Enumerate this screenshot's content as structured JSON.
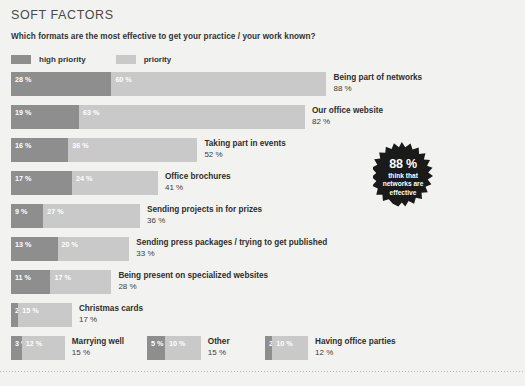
{
  "header": {
    "title": "SOFT FACTORS",
    "question": "Which formats are the most effective to get your practice / your work known?"
  },
  "legend": {
    "items": [
      {
        "label": "high priority",
        "color": "#8e8e8e",
        "key": "high"
      },
      {
        "label": "priority",
        "color": "#c9c9c9",
        "key": "normal"
      }
    ]
  },
  "badge": {
    "percent": "88 %",
    "caption": "think that networks are effective",
    "color": "#1a1a1a"
  },
  "chart_data": {
    "type": "bar",
    "title": "Which formats are the most effective to get your practice / your work known?",
    "subtitle": "SOFT FACTORS",
    "orientation": "horizontal",
    "stacked": true,
    "xlabel": "",
    "ylabel": "",
    "xlim": [
      0,
      88
    ],
    "grid": false,
    "legend_position": "top-left",
    "units": "%",
    "categories": [
      "Being part of networks",
      "Our office website",
      "Taking part in events",
      "Office brochures",
      "Sending projects in for prizes",
      "Sending press packages / trying to get published",
      "Being present on specialized websites",
      "Christmas cards",
      "Marrying well",
      "Other",
      "Having office parties"
    ],
    "series": [
      {
        "name": "high priority",
        "color": "#8e8e8e",
        "values": [
          28,
          19,
          16,
          17,
          9,
          13,
          11,
          2,
          3,
          5,
          2
        ]
      },
      {
        "name": "priority",
        "color": "#c9c9c9",
        "values": [
          60,
          63,
          36,
          24,
          27,
          20,
          17,
          15,
          12,
          10,
          10
        ]
      }
    ],
    "totals": [
      88,
      82,
      52,
      41,
      36,
      33,
      28,
      17,
      15,
      15,
      12
    ],
    "annotations": [
      {
        "text": "88 % think that networks are effective",
        "type": "starburst-badge"
      }
    ]
  },
  "rows": [
    {
      "name": "Being part of networks",
      "high": "28 %",
      "normal": "60 %",
      "total": "88 %",
      "high_val": 28,
      "normal_val": 60
    },
    {
      "name": "Our office website",
      "high": "19 %",
      "normal": "63 %",
      "total": "82 %",
      "high_val": 19,
      "normal_val": 63
    },
    {
      "name": "Taking part in events",
      "high": "16 %",
      "normal": "36 %",
      "total": "52 %",
      "high_val": 16,
      "normal_val": 36
    },
    {
      "name": "Office brochures",
      "high": "17 %",
      "normal": "24 %",
      "total": "41 %",
      "high_val": 17,
      "normal_val": 24
    },
    {
      "name": "Sending projects in for prizes",
      "high": "9 %",
      "normal": "27 %",
      "total": "36 %",
      "high_val": 9,
      "normal_val": 27
    },
    {
      "name": "Sending press packages / trying to get published",
      "high": "13 %",
      "normal": "20 %",
      "total": "33 %",
      "high_val": 13,
      "normal_val": 20
    },
    {
      "name": "Being present on specialized websites",
      "high": "11 %",
      "normal": "17 %",
      "total": "28 %",
      "high_val": 11,
      "normal_val": 17
    },
    {
      "name": "Christmas cards",
      "high": "2 %",
      "normal": "15 %",
      "total": "17 %",
      "high_val": 2,
      "normal_val": 15
    },
    {
      "name": "Marrying well",
      "high": "3 %",
      "normal": "12 %",
      "total": "15 %",
      "high_val": 3,
      "normal_val": 12
    },
    {
      "name": "Other",
      "high": "5 %",
      "normal": "10 %",
      "total": "15 %",
      "high_val": 5,
      "normal_val": 10
    },
    {
      "name": "Having office parties",
      "high": "2 %",
      "normal": "10 %",
      "total": "12 %",
      "high_val": 2,
      "normal_val": 10
    }
  ]
}
